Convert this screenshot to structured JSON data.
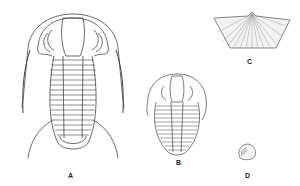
{
  "figure": {
    "background": "#ffffff",
    "ink_color": "#333333",
    "specimens": [
      {
        "id": "A",
        "label": "A",
        "kind": "trilobite-large-spined"
      },
      {
        "id": "B",
        "label": "B",
        "kind": "trilobite-small"
      },
      {
        "id": "C",
        "label": "C",
        "kind": "brachiopod-fan-shell"
      },
      {
        "id": "D",
        "label": "D",
        "kind": "small-coiled-shell"
      }
    ]
  }
}
